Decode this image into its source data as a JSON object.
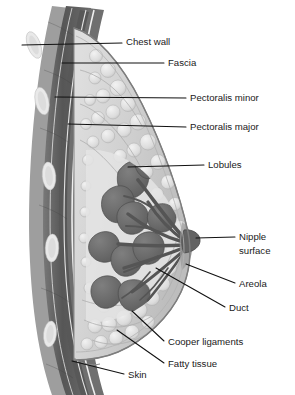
{
  "figure": {
    "orientation": "lateral cross-section, chest wall at left, nipple at right",
    "background_color": "#ffffff",
    "ink_color": "#1a1a1a",
    "palette": {
      "skin_outline": "#8a8a8a",
      "muscle_dark": "#5c5c5c",
      "muscle_mid": "#6e6e6e",
      "rib_fill": "#e9e9e9",
      "fat_globule": "#e2e2e2",
      "fat_field": "#c9c9c9",
      "glandular_field": "#d5d5d5",
      "lobule_dark": "#6a6a6a",
      "duct_dark": "#5a5a5a",
      "nipple": "#636363",
      "fascia_line": "#f2f2f2"
    },
    "labels": [
      {
        "id": "chest-wall",
        "text": "Chest wall",
        "x": 126,
        "y": 45,
        "anchor": "start",
        "leader": "M22,45 L122,43"
      },
      {
        "id": "fascia",
        "text": "Fascia",
        "x": 168,
        "y": 66,
        "anchor": "start",
        "leader": "M62,63 L164,63"
      },
      {
        "id": "pectoralis-minor",
        "text": "Pectoralis minor",
        "x": 190,
        "y": 101,
        "anchor": "start",
        "leader": "M55,97 L186,98"
      },
      {
        "id": "pectoralis-major",
        "text": "Pectoralis major",
        "x": 190,
        "y": 130,
        "anchor": "start",
        "leader": "M68,124 L186,127"
      },
      {
        "id": "lobules",
        "text": "Lobules",
        "x": 208,
        "y": 168,
        "anchor": "start",
        "leader": "M128,167 L204,165"
      },
      {
        "id": "nipple-surface-1",
        "text": "Nipple",
        "x": 239,
        "y": 240,
        "anchor": "start",
        "leader": "M196,238 L235,237"
      },
      {
        "id": "nipple-surface-2",
        "text": "surface",
        "x": 239,
        "y": 254,
        "anchor": "start",
        "leader": ""
      },
      {
        "id": "areola",
        "text": "Areola",
        "x": 239,
        "y": 287,
        "anchor": "start",
        "leader": "M186,264 L235,283"
      },
      {
        "id": "duct",
        "text": "Duct",
        "x": 229,
        "y": 311,
        "anchor": "start",
        "leader": "M156,268 L225,307"
      },
      {
        "id": "cooper-ligaments",
        "text": "Cooper ligaments",
        "x": 168,
        "y": 345,
        "anchor": "start",
        "leader": "M132,311 L164,341"
      },
      {
        "id": "fatty-tissue",
        "text": "Fatty tissue",
        "x": 168,
        "y": 367,
        "anchor": "start",
        "leader": "M117,330 L164,363"
      },
      {
        "id": "skin",
        "text": "Skin",
        "x": 128,
        "y": 378,
        "anchor": "start",
        "leader": "M72,361 L124,374"
      }
    ],
    "ribs": [
      {
        "id": "rib-1",
        "cx": 34,
        "cy": 45,
        "rx": 6.5,
        "ry": 14,
        "rot": -20,
        "caption": "rib"
      },
      {
        "id": "rib-2",
        "cx": 42,
        "cy": 101,
        "rx": 6.8,
        "ry": 14,
        "rot": -12,
        "caption": "rib"
      },
      {
        "id": "rib-3",
        "cx": 49,
        "cy": 176,
        "rx": 6.8,
        "ry": 14,
        "rot": -5,
        "caption": "rib"
      },
      {
        "id": "rib-4",
        "cx": 52,
        "cy": 248,
        "rx": 6.8,
        "ry": 14,
        "rot": 2,
        "caption": "rib"
      },
      {
        "id": "rib-5",
        "cx": 50,
        "cy": 334,
        "rx": 6.5,
        "ry": 13,
        "rot": 6,
        "caption": "rib"
      }
    ]
  }
}
